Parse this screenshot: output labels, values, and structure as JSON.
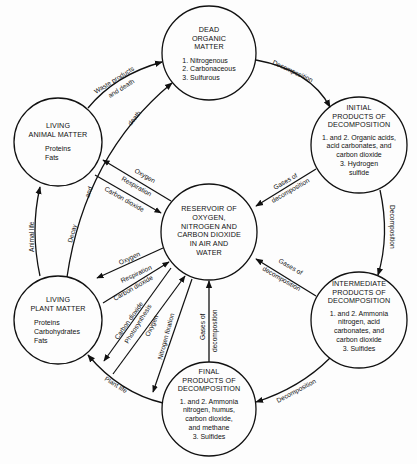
{
  "diagram": {
    "type": "cycle-diagram",
    "nodes": {
      "dead": {
        "title": [
          "DEAD",
          "ORGANIC",
          "MATTER"
        ],
        "items": [
          "1. Nitrogenous",
          "2. Carbonaceous",
          "3. Sulfurous"
        ]
      },
      "initial": {
        "title": [
          "INITIAL",
          "PRODUCTS OF",
          "DECOMPOSITION"
        ],
        "items": [
          "1. and 2. Organic acids,",
          "acid carbonates, and",
          "carbon dioxide",
          "3. Hydrogen",
          "sulfide"
        ]
      },
      "intermediate": {
        "title": [
          "INTERMEDIATE",
          "PRODUCTS OF",
          "DECOMPOSITION"
        ],
        "items": [
          "1. and 2. Ammonia",
          "nitrogen, acid",
          "carbonates, and",
          "carbon dioxide",
          "3. Sulfides"
        ]
      },
      "final": {
        "title": [
          "FINAL",
          "PRODUCTS OF",
          "DECOMPOSITION"
        ],
        "items": [
          "1. and 2. Ammonia",
          "nitrogen, humus,",
          "carbon dioxide,",
          "and methane",
          "3. Sulfides"
        ]
      },
      "plant": {
        "title": [
          "LIVING",
          "PLANT MATTER"
        ],
        "items": [
          "Proteins",
          "Carbohydrates",
          "Fats"
        ]
      },
      "animal": {
        "title": [
          "LIVING",
          "ANIMAL MATTER"
        ],
        "items": [
          "Proteins",
          "Fats"
        ]
      },
      "reservoir": {
        "title": [
          "RESERVOIR OF",
          "OXYGEN,",
          "NITROGEN AND",
          "CARBON DIOXIDE",
          "IN AIR AND",
          "WATER"
        ]
      }
    },
    "edges": {
      "dead_to_initial": "Decomposition",
      "initial_to_intermediate": "Decomposition",
      "intermediate_to_final": "Decomposition",
      "final_to_plant": "Plant life",
      "plant_to_animal": "Animal life",
      "animal_to_dead": [
        "Waste products",
        "and death"
      ],
      "plant_to_dead": [
        "Decay",
        "and",
        "death"
      ],
      "initial_to_reservoir": [
        "Gases of",
        "decomposition"
      ],
      "intermediate_to_reservoir": [
        "Gases of",
        "decomposition"
      ],
      "final_to_reservoir": [
        "Gases of",
        "decomposition"
      ],
      "animal_reservoir": [
        "Oxygen",
        "Respiration",
        "Carbon dioxide"
      ],
      "plant_reservoir_upper": [
        "Oxygen",
        "Respiration",
        "Carbon dioxide"
      ],
      "plant_reservoir_lower": [
        "Carbon dioxide",
        "Photosynthesis",
        "Oxygen",
        "Nitrogen fixation"
      ]
    }
  }
}
